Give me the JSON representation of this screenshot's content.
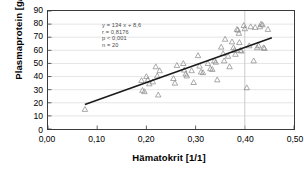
{
  "chart_data": {
    "type": "scatter",
    "title": "",
    "xlabel": "Hämatokrit  [1/1]",
    "ylabel": "Plasmaprotein  [g/l]",
    "xlim": [
      0.0,
      0.5
    ],
    "ylim": [
      0,
      90
    ],
    "xticks": [
      "0,00",
      "0,10",
      "0,20",
      "0,30",
      "0,40",
      "0,50"
    ],
    "xtick_values": [
      0.0,
      0.1,
      0.2,
      0.3,
      0.4,
      0.5
    ],
    "yticks": [
      "0",
      "10",
      "20",
      "30",
      "40",
      "50",
      "60",
      "70",
      "80",
      "90"
    ],
    "ytick_values": [
      0,
      10,
      20,
      30,
      40,
      50,
      60,
      70,
      80,
      90
    ],
    "grid": "horizontal",
    "grid_color": "#d9d9d9",
    "marker": "open-triangle",
    "marker_color": "#8c8c8c",
    "legend": "none",
    "series": [
      {
        "name": "Messwerte",
        "points": [
          [
            0.075,
            15.0
          ],
          [
            0.19,
            37.0
          ],
          [
            0.192,
            29.5
          ],
          [
            0.196,
            28.5
          ],
          [
            0.2,
            40.0
          ],
          [
            0.203,
            37.5
          ],
          [
            0.206,
            34.5
          ],
          [
            0.213,
            36.0
          ],
          [
            0.219,
            47.5
          ],
          [
            0.222,
            40.5
          ],
          [
            0.224,
            26.0
          ],
          [
            0.227,
            44.5
          ],
          [
            0.255,
            38.5
          ],
          [
            0.258,
            35.0
          ],
          [
            0.262,
            48.5
          ],
          [
            0.275,
            50.0
          ],
          [
            0.277,
            45.0
          ],
          [
            0.28,
            42.0
          ],
          [
            0.282,
            40.5
          ],
          [
            0.292,
            44.5
          ],
          [
            0.296,
            35.5
          ],
          [
            0.305,
            56.0
          ],
          [
            0.308,
            48.0
          ],
          [
            0.311,
            43.5
          ],
          [
            0.315,
            43.0
          ],
          [
            0.325,
            50.0
          ],
          [
            0.33,
            46.0
          ],
          [
            0.334,
            45.5
          ],
          [
            0.338,
            52.0
          ],
          [
            0.341,
            51.0
          ],
          [
            0.344,
            37.5
          ],
          [
            0.352,
            62.5
          ],
          [
            0.356,
            57.5
          ],
          [
            0.358,
            52.0
          ],
          [
            0.36,
            68.5
          ],
          [
            0.366,
            55.5
          ],
          [
            0.369,
            47.5
          ],
          [
            0.374,
            66.5
          ],
          [
            0.377,
            62.0
          ],
          [
            0.379,
            60.0
          ],
          [
            0.381,
            57.0
          ],
          [
            0.384,
            76.0
          ],
          [
            0.386,
            75.5
          ],
          [
            0.388,
            73.0
          ],
          [
            0.389,
            66.0
          ],
          [
            0.391,
            60.0
          ],
          [
            0.393,
            59.5
          ],
          [
            0.398,
            79.0
          ],
          [
            0.4,
            76.5
          ],
          [
            0.404,
            31.5
          ],
          [
            0.409,
            63.5
          ],
          [
            0.412,
            78.0
          ],
          [
            0.418,
            52.0
          ],
          [
            0.421,
            77.5
          ],
          [
            0.425,
            62.0
          ],
          [
            0.428,
            63.5
          ],
          [
            0.431,
            78.0
          ],
          [
            0.433,
            80.0
          ],
          [
            0.436,
            79.5
          ],
          [
            0.438,
            62.0
          ],
          [
            0.44,
            61.5
          ],
          [
            0.447,
            76.0
          ]
        ]
      }
    ],
    "fit_line": {
      "slope": 134,
      "intercept": 8.6,
      "x_start": 0.075,
      "x_end": 0.455,
      "color": "#1a1a1a"
    },
    "reference_line": {
      "orientation": "vertical",
      "x": 0.4,
      "color": "#c9c9c9"
    },
    "annotation": {
      "equation": "y = 134 x + 8,6",
      "correlation": "r  = 0,8176",
      "pvalue": "p < 0,001",
      "samplesize": "n  = 20"
    }
  }
}
